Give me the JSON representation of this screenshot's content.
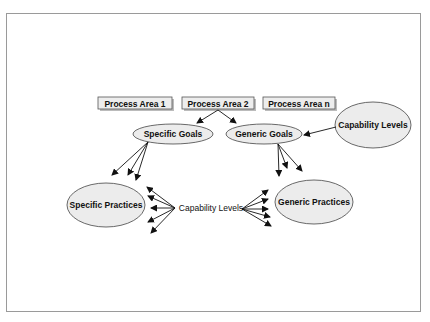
{
  "diagram": {
    "process_areas": [
      "Process Area 1",
      "Process Area 2",
      "Process Area n"
    ],
    "nodes": {
      "specific_goals": "Specific Goals",
      "generic_goals": "Generic Goals",
      "capability_levels_top": "Capability Levels",
      "specific_practices": "Specific Practices",
      "generic_practices": "Generic Practices",
      "capability_levels_center": "Capability Levels"
    },
    "edges": [
      {
        "from": "Process Area 2",
        "to": "Specific Goals"
      },
      {
        "from": "Process Area 2",
        "to": "Generic Goals"
      },
      {
        "from": "Capability Levels (top)",
        "to": "Generic Goals"
      },
      {
        "from": "Specific Goals",
        "to": "Specific Practices",
        "count": 3
      },
      {
        "from": "Generic Goals",
        "to": "Generic Practices",
        "count": 3
      },
      {
        "from": "Capability Levels (center)",
        "to": "Specific Practices",
        "count": 5
      },
      {
        "from": "Capability Levels (center)",
        "to": "Generic Practices",
        "count": 5
      }
    ],
    "colors": {
      "ellipse_fill": "#ececec",
      "box_fill": "#ededed",
      "stroke": "#333333",
      "frame": "#9a9a9a"
    }
  }
}
